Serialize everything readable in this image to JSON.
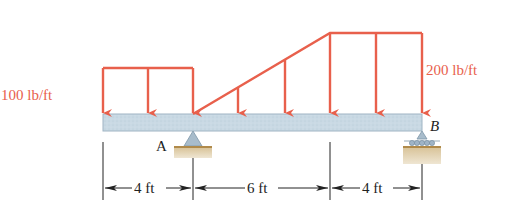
{
  "diagram": {
    "type": "beam-loading",
    "loads": {
      "left_label": "100 lb/ft",
      "right_label": "200 lb/ft",
      "color": "#e8604c"
    },
    "supports": {
      "a_label": "A",
      "b_label": "B"
    },
    "dimensions": [
      {
        "label": "4 ft"
      },
      {
        "label": "6 ft"
      },
      {
        "label": "4 ft"
      }
    ],
    "colors": {
      "beam_fill": "#c5d6e2",
      "beam_stroke": "#8fa8b8",
      "ground": "#d8c7a4",
      "ground_line": "#b08a4a",
      "support": "#a8bccb",
      "dimension_line": "#222222"
    }
  }
}
